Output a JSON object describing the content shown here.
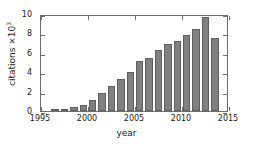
{
  "chart_data": {
    "type": "bar",
    "title": "",
    "xlabel": "year",
    "ylabel_text": "citations ×10",
    "ylabel_exponent": "3",
    "ylabel": "citations ×10³",
    "xlim": [
      1995,
      2015
    ],
    "ylim": [
      0,
      10
    ],
    "xticks": [
      1995,
      2000,
      2005,
      2010,
      2015
    ],
    "yticks": [
      0,
      2,
      4,
      6,
      8,
      10
    ],
    "grid": false,
    "legend": null,
    "bar_color": "#808080",
    "bar_edge_color": "#5f5f5f",
    "axis_color": "#6e6e6e",
    "categories": [
      1996,
      1997,
      1998,
      1999,
      2000,
      2001,
      2002,
      2003,
      2004,
      2005,
      2006,
      2007,
      2008,
      2009,
      2010,
      2011,
      2012,
      2013
    ],
    "values": [
      0.1,
      0.15,
      0.4,
      0.6,
      1.15,
      1.9,
      2.6,
      3.25,
      4.0,
      5.2,
      5.5,
      6.25,
      6.9,
      7.25,
      7.85,
      8.5,
      9.7,
      7.5
    ],
    "value_unit": "thousands of citations"
  }
}
